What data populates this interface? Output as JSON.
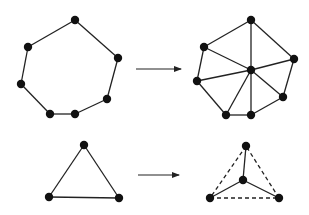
{
  "colors": {
    "stroke": "#222222",
    "node": "#111111",
    "background": "#ffffff"
  },
  "diagrams": [
    {
      "name": "heptagon-before",
      "nodes": [
        [
          75,
          20
        ],
        [
          28,
          47
        ],
        [
          21,
          84
        ],
        [
          50,
          114
        ],
        [
          75,
          114
        ],
        [
          107,
          99
        ],
        [
          118,
          58
        ]
      ],
      "solid_edges": [
        [
          0,
          1
        ],
        [
          1,
          2
        ],
        [
          2,
          3
        ],
        [
          3,
          4
        ],
        [
          4,
          5
        ],
        [
          5,
          6
        ],
        [
          6,
          0
        ]
      ],
      "dashed_edges": []
    },
    {
      "name": "heptagon-after",
      "nodes": [
        [
          251,
          20
        ],
        [
          204,
          47
        ],
        [
          197,
          81
        ],
        [
          226,
          115
        ],
        [
          251,
          115
        ],
        [
          283,
          97
        ],
        [
          294,
          59
        ],
        [
          251,
          70
        ]
      ],
      "solid_edges": [
        [
          0,
          1
        ],
        [
          1,
          2
        ],
        [
          2,
          3
        ],
        [
          3,
          4
        ],
        [
          4,
          5
        ],
        [
          5,
          6
        ],
        [
          6,
          0
        ],
        [
          7,
          0
        ],
        [
          7,
          1
        ],
        [
          7,
          2
        ],
        [
          7,
          3
        ],
        [
          7,
          4
        ],
        [
          7,
          5
        ],
        [
          7,
          6
        ]
      ],
      "dashed_edges": []
    },
    {
      "name": "triangle-before",
      "nodes": [
        [
          84,
          145
        ],
        [
          49,
          197
        ],
        [
          119,
          198
        ]
      ],
      "solid_edges": [
        [
          0,
          1
        ],
        [
          1,
          2
        ],
        [
          2,
          0
        ]
      ],
      "dashed_edges": []
    },
    {
      "name": "triangle-after",
      "nodes": [
        [
          246,
          146
        ],
        [
          210,
          198
        ],
        [
          279,
          198
        ],
        [
          243,
          180
        ]
      ],
      "solid_edges": [
        [
          3,
          0
        ],
        [
          3,
          1
        ],
        [
          3,
          2
        ]
      ],
      "dashed_edges": [
        [
          0,
          1
        ],
        [
          1,
          2
        ],
        [
          2,
          0
        ]
      ]
    }
  ],
  "arrows": [
    {
      "name": "arrow-top",
      "from": [
        136,
        69
      ],
      "to": [
        181,
        69
      ]
    },
    {
      "name": "arrow-bottom",
      "from": [
        138,
        175
      ],
      "to": [
        179,
        175
      ]
    }
  ]
}
